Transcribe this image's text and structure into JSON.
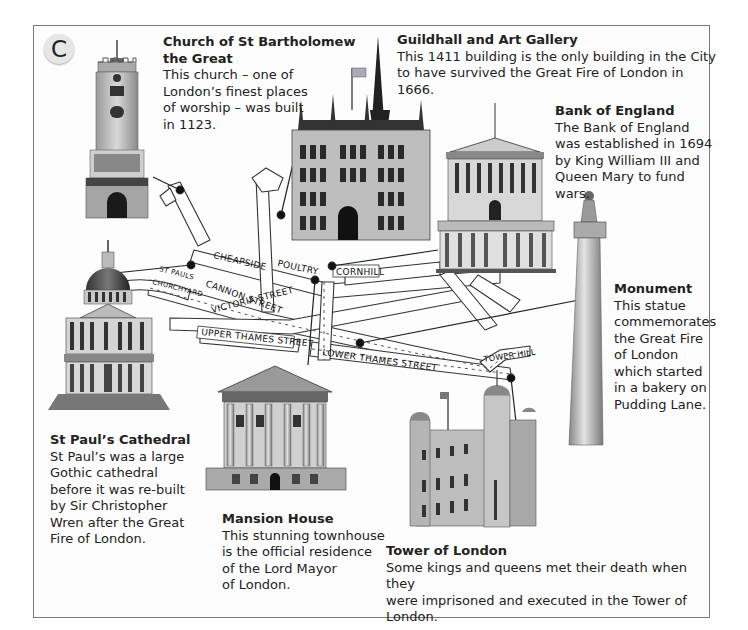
{
  "badge": {
    "letter": "C"
  },
  "landmarks": [
    {
      "id": "st-bartholomew",
      "title_line1": "Church of St Bartholomew",
      "title_line2": "the Great",
      "body_lines": [
        "This church – one of",
        "London’s finest places",
        "of worship – was built",
        "in 1123."
      ]
    },
    {
      "id": "guildhall",
      "title": "Guildhall and Art Gallery",
      "body_lines": [
        "This 1411 building is the only building in the City",
        "to have survived the Great Fire of London in 1666."
      ]
    },
    {
      "id": "bank-of-england",
      "title": "Bank of England",
      "body_lines": [
        "The Bank of England",
        "was established in 1694",
        "by King William III and",
        "Queen Mary to fund wars."
      ]
    },
    {
      "id": "monument",
      "title": "Monument",
      "body_lines": [
        "This statue",
        "commemorates",
        "the Great Fire",
        "of London",
        "which started",
        "in a bakery on",
        "Pudding Lane."
      ]
    },
    {
      "id": "st-pauls",
      "title": "St Paul’s Cathedral",
      "body_lines": [
        "St Paul’s was a large",
        "Gothic cathedral",
        "before it was re-built",
        "by Sir Christopher",
        "Wren after the Great",
        "Fire of London."
      ]
    },
    {
      "id": "mansion-house",
      "title": "Mansion House",
      "body_lines": [
        "This stunning townhouse",
        "is the official residence",
        "of the Lord Mayor",
        "of London."
      ]
    },
    {
      "id": "tower-of-london",
      "title": "Tower of London",
      "body_lines": [
        "Some kings and queens met their death when they",
        "were imprisoned and executed in the Tower of London."
      ]
    }
  ],
  "map": {
    "streets": {
      "cheapside": "CHEAPSIDE",
      "poultry": "POULTRY",
      "cornhill": "CORNHILL",
      "st_pauls_churchyard_1": "ST PAULS",
      "st_pauls_churchyard_2": "CHURCHYARD",
      "cannon_street": "CANNON   STREET",
      "victoria_street": "VICTORIA   STREET",
      "upper_thames_street": "UPPER THAMES STREET",
      "lower_thames_street": "LOWER THAMES STREET",
      "tower_hill": "TOWER HILL"
    }
  },
  "colors": {
    "text": "#222222",
    "frame_border": "#7a7a7a",
    "badge_bg": "#e6e6e6",
    "street_outline": "#333333",
    "leader_line": "#222222"
  }
}
